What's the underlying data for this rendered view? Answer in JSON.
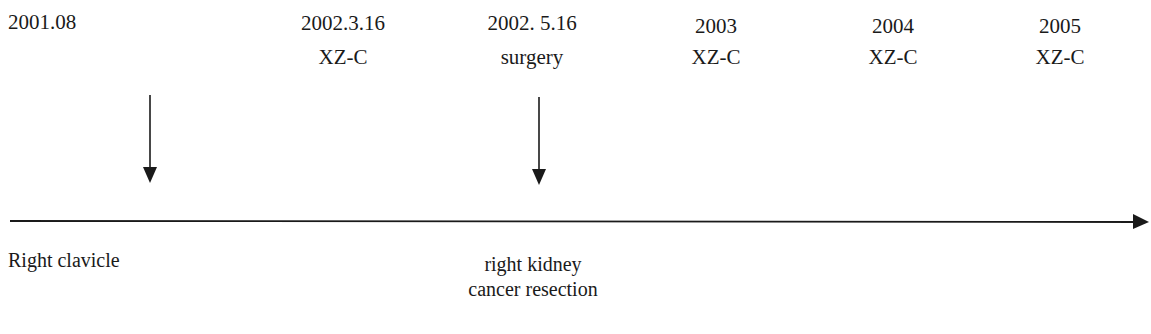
{
  "timeline": {
    "events_top": [
      {
        "date": "2001.08",
        "label": ""
      },
      {
        "date": "2002.3.16",
        "label": "XZ-C"
      },
      {
        "date": "2002. 5.16",
        "label": "surgery"
      },
      {
        "date": "2003",
        "label": "XZ-C"
      },
      {
        "date": "2004",
        "label": "XZ-C"
      },
      {
        "date": "2005",
        "label": "XZ-C"
      }
    ],
    "events_bottom": [
      {
        "line1": "Right clavicle",
        "line2": ""
      },
      {
        "line1": "right kidney",
        "line2": "cancer resection"
      }
    ],
    "arrow_icon": "down-arrow-icon",
    "axis_icon": "right-arrow-icon",
    "line_color": "#1a1a1a"
  }
}
